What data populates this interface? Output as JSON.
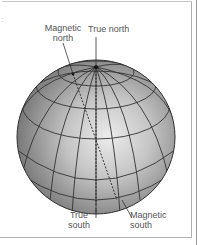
{
  "diagram": {
    "labels": {
      "magnetic_north_line1": "Magnetic",
      "magnetic_north_line2": "north",
      "true_north": "True north",
      "true_south_line1": "True",
      "true_south_line2": "south",
      "magnetic_south_line1": "Magnetic",
      "magnetic_south_line2": "south"
    },
    "colors": {
      "globe_dark": "#7d7d7d",
      "globe_light": "#e4e4e4",
      "grid_lines": "#333333",
      "label_text": "#555555",
      "border": "#b0b0b0"
    }
  }
}
